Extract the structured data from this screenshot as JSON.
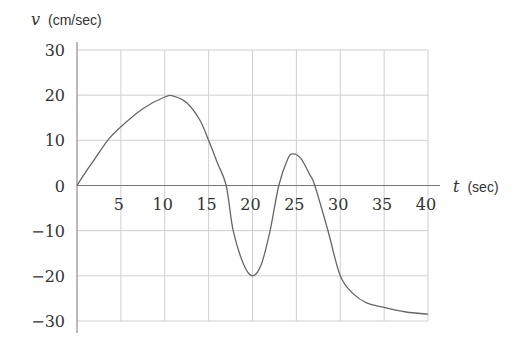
{
  "chart_data": {
    "type": "line",
    "title": "",
    "xlabel": "t (sec)",
    "ylabel": "v (cm/sec)",
    "xlabel_var": "t",
    "xlabel_unit": "(sec)",
    "ylabel_var": "v",
    "ylabel_unit": "(cm/sec)",
    "xlim": [
      0,
      40
    ],
    "ylim": [
      -30,
      30
    ],
    "grid": true,
    "legend": "none",
    "x_ticks": [
      5,
      10,
      15,
      20,
      25,
      30,
      35,
      40
    ],
    "x_tick_labels": [
      "5",
      "10",
      "15",
      "20",
      "25",
      "30",
      "35",
      "40"
    ],
    "y_ticks": [
      30,
      20,
      10,
      0,
      -10,
      -20,
      -30
    ],
    "y_tick_labels": [
      "30",
      "20",
      "10",
      "0",
      "−10",
      "−20",
      "−30"
    ],
    "series": [
      {
        "name": "v(t)",
        "color": "#666666",
        "x": [
          0,
          1,
          2,
          3.5,
          5,
          7.5,
          10,
          11,
          12.5,
          14,
          15,
          16,
          17,
          17.8,
          19,
          20,
          21,
          22,
          23,
          24,
          24.6,
          25.5,
          26.5,
          27.1,
          28.6,
          30,
          31.5,
          33,
          35,
          37.5,
          40
        ],
        "values": [
          0,
          3,
          5.8,
          10,
          13,
          17,
          19.6,
          19.8,
          18.3,
          14.5,
          10,
          5,
          0,
          -10,
          -17.5,
          -20,
          -17.5,
          -10,
          0,
          5.8,
          7,
          6,
          2.5,
          0,
          -10,
          -20,
          -24,
          -26,
          -27,
          -28,
          -28.5
        ]
      }
    ]
  },
  "labels": {
    "y_var": "v",
    "y_unit": "(cm/sec)",
    "x_var": "t",
    "x_unit": "(sec)"
  }
}
